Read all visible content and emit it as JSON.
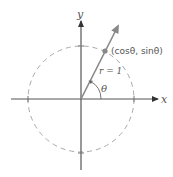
{
  "diagram": {
    "colors": {
      "axis": "#4a4a4a",
      "circle": "#aaaaaa",
      "ray": "#888888",
      "point": "#888888",
      "text": "#555555"
    },
    "axes": {
      "x_label": "x",
      "y_label": "y"
    },
    "labels": {
      "point": "(cosθ, sinθ)",
      "radius": "r = 1",
      "angle": "θ"
    },
    "geometry": {
      "center": [
        81,
        99
      ],
      "radius": 53,
      "angle_deg": 62
    }
  }
}
